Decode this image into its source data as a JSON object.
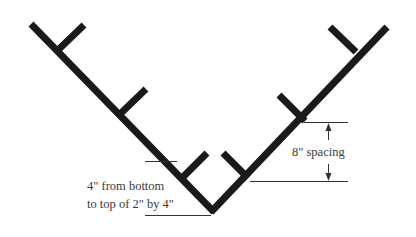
{
  "diagram": {
    "colors": {
      "stroke": "#1a1a1a",
      "dimension": "#333333",
      "text": "#3a3a3a",
      "background": "#ffffff"
    },
    "labels": {
      "spacing": "8\" spacing",
      "bottom_line1": "4\" from bottom",
      "bottom_line2": "to top of 2\" by 4\""
    }
  }
}
